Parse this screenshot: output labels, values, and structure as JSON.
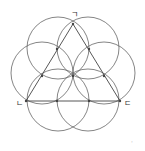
{
  "diagram": {
    "stroke_color": "#555555",
    "labels": {
      "top": "ㄱ",
      "bottom_left": "ㄴ",
      "bottom_right": "ㄷ"
    },
    "triangle": {
      "vertices": [
        [
          73,
          24
        ],
        [
          26,
          101
        ],
        [
          120,
          101
        ]
      ]
    },
    "circles": [
      {
        "cx": 58,
        "cy": 48,
        "r": 31
      },
      {
        "cx": 88,
        "cy": 48,
        "r": 31
      },
      {
        "cx": 42,
        "cy": 73,
        "r": 31
      },
      {
        "cx": 104,
        "cy": 73,
        "r": 31
      },
      {
        "cx": 58,
        "cy": 100,
        "r": 31
      },
      {
        "cx": 88,
        "cy": 100,
        "r": 31
      }
    ],
    "points": [
      [
        73,
        24
      ],
      [
        57,
        49
      ],
      [
        89,
        49
      ],
      [
        42,
        76
      ],
      [
        73,
        76
      ],
      [
        104,
        76
      ],
      [
        26,
        101
      ],
      [
        57,
        101
      ],
      [
        89,
        101
      ],
      [
        120,
        101
      ]
    ],
    "corner_mark": "·"
  }
}
